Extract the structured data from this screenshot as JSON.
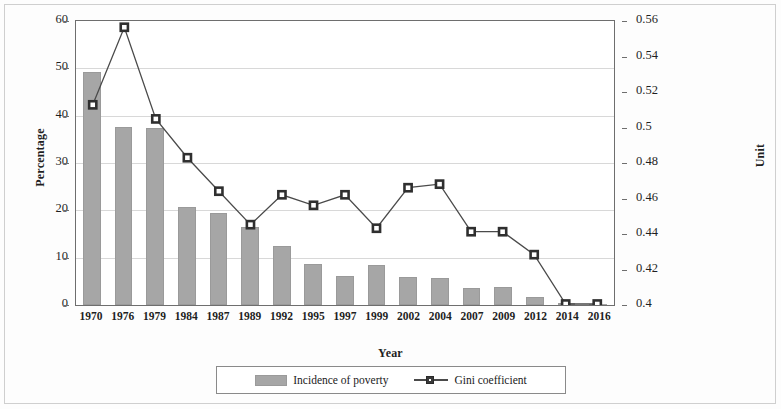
{
  "chart_data": {
    "type": "bar",
    "title": "",
    "xlabel": "Year",
    "ylabel": "Percentage",
    "y2label": "Unit",
    "categories": [
      "1970",
      "1976",
      "1979",
      "1984",
      "1987",
      "1989",
      "1992",
      "1995",
      "1997",
      "1999",
      "2002",
      "2004",
      "2007",
      "2009",
      "2012",
      "2014",
      "2016"
    ],
    "ylim": [
      0,
      60
    ],
    "yticks": [
      0,
      10,
      20,
      30,
      40,
      50,
      60
    ],
    "ytick_labels": [
      "0",
      "10",
      "20",
      "30",
      "40",
      "50",
      "60"
    ],
    "y2lim": [
      0.4,
      0.56
    ],
    "y2ticks": [
      0.4,
      0.42,
      0.44,
      0.46,
      0.48,
      0.5,
      0.52,
      0.54,
      0.56
    ],
    "y2tick_labels": [
      "0.4",
      "0.42",
      "0.44",
      "0.46",
      "0.48",
      "0.5",
      "0.52",
      "0.54",
      "0.56"
    ],
    "grid": true,
    "legend_position": "bottom",
    "series": [
      {
        "name": "Incidence of poverty",
        "type": "bar",
        "axis": "left",
        "color": "#a6a6a6",
        "values": [
          49.3,
          37.7,
          37.4,
          20.7,
          19.4,
          16.5,
          12.4,
          8.7,
          6.1,
          8.5,
          6.0,
          5.7,
          3.6,
          3.8,
          1.7,
          0.4,
          0.2
        ]
      },
      {
        "name": "Gini coefficient",
        "type": "line",
        "axis": "right",
        "color": "#4a4a4a",
        "marker": "square",
        "values": [
          0.513,
          0.557,
          0.505,
          0.483,
          0.464,
          0.445,
          0.462,
          0.456,
          0.462,
          0.443,
          0.466,
          0.468,
          0.441,
          0.441,
          0.428,
          0.4,
          0.4
        ]
      }
    ]
  },
  "legend": {
    "items": [
      {
        "label": "Incidence of poverty",
        "swatch": "bar-swatch"
      },
      {
        "label": "Gini coefficient",
        "swatch": "line-marker-swatch"
      }
    ]
  },
  "colors": {
    "bar": "#a6a6a6",
    "line": "#4a4a4a",
    "grid": "#d8d8d8",
    "axis": "#6e6e6e",
    "background": "#ffffff"
  }
}
